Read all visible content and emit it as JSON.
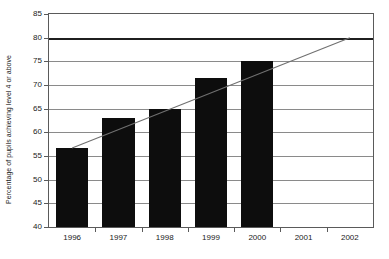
{
  "chart_data": {
    "type": "bar",
    "title": "",
    "subtitle": "",
    "xlabel": "",
    "ylabel": "Percentage of pupils achieving level 4 or above",
    "categories": [
      "1996",
      "1997",
      "1998",
      "1999",
      "2000",
      "2001",
      "2002"
    ],
    "values": [
      56.7,
      63.0,
      65.0,
      71.5,
      75.0,
      null,
      null
    ],
    "ylim": [
      40,
      85
    ],
    "yticks": [
      40,
      45,
      50,
      55,
      60,
      65,
      70,
      75,
      80,
      85
    ],
    "ytick_labels": [
      "40",
      "45",
      "50",
      "55",
      "60",
      "65",
      "70",
      "75",
      "80",
      "85"
    ],
    "grid": "horizontal",
    "legend": "none",
    "series": [
      {
        "name": "Percentage achieving level 4 or above",
        "type": "bar",
        "color": "#0d0d0d",
        "values": [
          56.7,
          63.0,
          65.0,
          71.5,
          75.0,
          null,
          null
        ]
      },
      {
        "name": "Target",
        "type": "line",
        "color": "#1f1f1f",
        "style": "thick-horizontal",
        "value": 80
      },
      {
        "name": "Trajectory",
        "type": "line",
        "color": "#707070",
        "style": "thin-diagonal",
        "points": [
          {
            "x": "1996",
            "y": 56.7
          },
          {
            "x": "2002",
            "y": 80.0
          }
        ]
      }
    ],
    "annotations": []
  },
  "axes": {
    "y_title": "Percentage of pupils achieving level 4 or above"
  },
  "colors": {
    "bar": "#0d0d0d",
    "gridline": "#8a8a8a",
    "target_line": "#1f1f1f",
    "trend_line": "#707070",
    "frame": "#5a5a5a",
    "background": "#ffffff",
    "text": "#1a1a1a"
  }
}
